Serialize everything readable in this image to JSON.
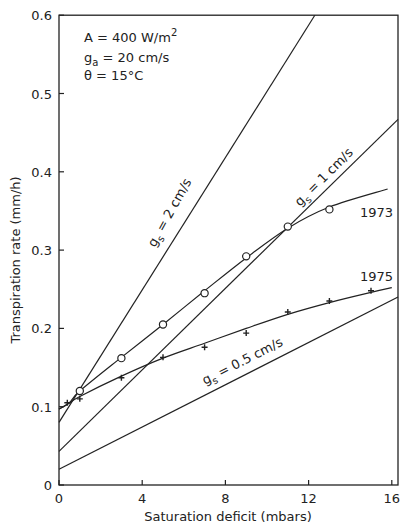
{
  "chart_data": {
    "type": "line",
    "title": "",
    "xlabel": "Saturation deficit (mbars)",
    "ylabel": "Transpiration rate (mm/h)",
    "xlim": [
      0,
      16.3
    ],
    "ylim": [
      0,
      0.6
    ],
    "xticks": [
      0,
      4,
      8,
      12,
      16
    ],
    "yticks": [
      0,
      0.1,
      0.2,
      0.3,
      0.4,
      0.5,
      0.6
    ],
    "ytick_labels": [
      "0",
      "0.1",
      "0.2",
      "0.3",
      "0.4",
      "0.5",
      "0.6"
    ],
    "xtick_labels": [
      "0",
      "4",
      "8",
      "12",
      "16"
    ],
    "grid": false,
    "annotations": {
      "line1": "A = 400 W/m",
      "line1_sup": "2",
      "line2_main": "g",
      "line2_sub": "a",
      "line2_rest": "= 20 cm/s",
      "line3": "θ  =  15°C"
    },
    "series": [
      {
        "name": "g_s = 2 cm/s",
        "label_main": "g",
        "label_sub": "s",
        "label_rest": " = 2 cm/s",
        "kind": "line",
        "x": [
          0,
          12.3
        ],
        "y": [
          0.08,
          0.6
        ]
      },
      {
        "name": "g_s = 1 cm/s",
        "label_main": "g",
        "label_sub": "s",
        "label_rest": " = 1 cm/s",
        "kind": "line",
        "x": [
          0,
          16.3
        ],
        "y": [
          0.043,
          0.467
        ]
      },
      {
        "name": "g_s = 0.5 cm/s",
        "label_main": "g",
        "label_sub": "s",
        "label_rest": " = 0.5 cm/s",
        "kind": "line",
        "x": [
          0,
          16.3
        ],
        "y": [
          0.02,
          0.24
        ]
      },
      {
        "name": "1973",
        "label": "1973",
        "kind": "curve",
        "marker": "circle",
        "x": [
          1,
          3,
          5,
          7,
          9,
          11,
          13
        ],
        "y": [
          0.12,
          0.162,
          0.205,
          0.245,
          0.292,
          0.33,
          0.352
        ],
        "curve_x": [
          0,
          0.5,
          1,
          3,
          5,
          7,
          9,
          11,
          13,
          15.8
        ],
        "curve_y": [
          0.097,
          0.105,
          0.12,
          0.163,
          0.205,
          0.248,
          0.29,
          0.328,
          0.355,
          0.378
        ]
      },
      {
        "name": "1975",
        "label": "1975",
        "kind": "curve",
        "marker": "cross",
        "x": [
          0.4,
          1,
          3,
          5,
          7,
          9,
          11,
          13,
          15
        ],
        "y": [
          0.105,
          0.11,
          0.137,
          0.163,
          0.176,
          0.194,
          0.221,
          0.235,
          0.248
        ],
        "curve_x": [
          0,
          0.4,
          1,
          3,
          5,
          7,
          9,
          11,
          13,
          15,
          16
        ],
        "curve_y": [
          0.097,
          0.103,
          0.113,
          0.139,
          0.162,
          0.181,
          0.2,
          0.218,
          0.233,
          0.246,
          0.252
        ]
      }
    ]
  }
}
